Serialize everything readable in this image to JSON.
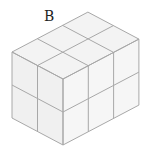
{
  "figure": {
    "label": "B",
    "dimensions": {
      "left_depth": 2,
      "right_width": 3,
      "height": 2
    },
    "cube_count": 12,
    "colors": {
      "edge": "#a8a8a8",
      "top_face": "#f3f3f3",
      "left_face": "#f0f0f0",
      "right_face": "#f6f6f6"
    }
  }
}
